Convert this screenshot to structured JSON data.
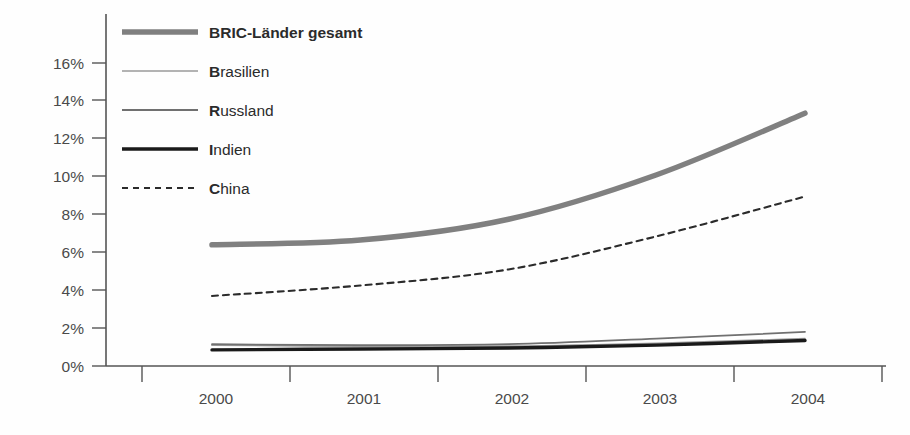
{
  "chart_data": {
    "type": "line",
    "title": "",
    "subtitle": "",
    "xlabel": "",
    "ylabel": "",
    "x": [
      "2000",
      "2001",
      "2002",
      "2003",
      "2004"
    ],
    "categories": [
      "2000",
      "2001",
      "2002",
      "2003",
      "2004"
    ],
    "ylim": [
      0,
      17
    ],
    "yticks": [
      0,
      2,
      4,
      6,
      8,
      10,
      12,
      14,
      16
    ],
    "ytick_labels": [
      "0%",
      "2%",
      "4%",
      "6%",
      "8%",
      "10%",
      "12%",
      "14%",
      "16%"
    ],
    "xtick_labels": [
      "2000",
      "2001",
      "2002",
      "2003",
      "2004"
    ],
    "grid": false,
    "legend_position": "top-left-inside",
    "value_unit": "%",
    "series": [
      {
        "name": "BRIC-Länder gesamt",
        "style": "solid-thick",
        "color": "#808080",
        "values": [
          6.4,
          6.65,
          7.75,
          10.1,
          13.35
        ]
      },
      {
        "name": "Brasilien",
        "style": "solid-thin",
        "color": "#9a9a9a",
        "values": [
          1.1,
          1.05,
          1.05,
          1.2,
          1.45
        ]
      },
      {
        "name": "Russland",
        "style": "solid-thin",
        "color": "#707070",
        "values": [
          1.15,
          1.1,
          1.15,
          1.45,
          1.8
        ]
      },
      {
        "name": "Indien",
        "style": "solid-bold",
        "color": "#1a1a1a",
        "values": [
          0.85,
          0.9,
          0.95,
          1.1,
          1.35
        ]
      },
      {
        "name": "China",
        "style": "dashed",
        "color": "#2b2b2b",
        "values": [
          3.7,
          4.25,
          5.1,
          6.85,
          8.95
        ]
      }
    ]
  },
  "legend": {
    "items": [
      {
        "label": "BRIC-Länder gesamt",
        "initial": "",
        "rest": "BRIC-Länder gesamt",
        "swatch": "bric-swatch"
      },
      {
        "label": "Brasilien",
        "initial": "B",
        "rest": "rasilien",
        "swatch": "brasilien-swatch"
      },
      {
        "label": "Russland",
        "initial": "R",
        "rest": "ussland",
        "swatch": "russland-swatch"
      },
      {
        "label": "Indien",
        "initial": "I",
        "rest": "ndien",
        "swatch": "indien-swatch"
      },
      {
        "label": "China",
        "initial": "C",
        "rest": "hina",
        "swatch": "china-swatch"
      }
    ]
  },
  "axis": {
    "y_labels": [
      "16%",
      "14%",
      "12%",
      "10%",
      "8%",
      "6%",
      "4%",
      "2%",
      "0%"
    ],
    "x_labels": [
      "2000",
      "2001",
      "2002",
      "2003",
      "2004"
    ]
  }
}
